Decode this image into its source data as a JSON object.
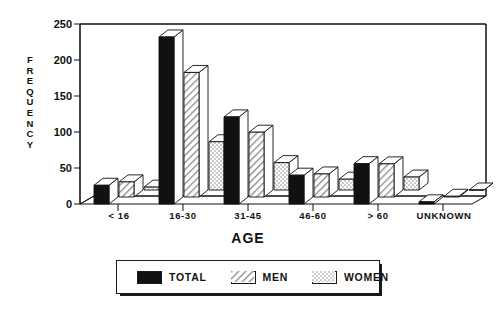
{
  "chart_data": {
    "type": "bar",
    "title": "",
    "xlabel": "AGE",
    "ylabel": "FREQUENCY",
    "categories": [
      "< 16",
      "16-30",
      "31-45",
      "46-60",
      "> 60",
      "UNKNOWN"
    ],
    "series": [
      {
        "name": "TOTAL",
        "values": [
          26,
          232,
          121,
          40,
          56,
          3
        ]
      },
      {
        "name": "MEN",
        "values": [
          21,
          173,
          90,
          32,
          46,
          1
        ]
      },
      {
        "name": "WOMEN",
        "values": [
          4,
          67,
          38,
          15,
          18,
          0
        ]
      }
    ],
    "ylim": [
      0,
      250
    ],
    "yticks": [
      0,
      50,
      100,
      150,
      200,
      250
    ],
    "ytick_labels": [
      "0",
      "50",
      "100",
      "150",
      "200",
      "250"
    ],
    "grid": false,
    "legend_position": "bottom",
    "style": "3d-grouped-bar"
  },
  "axes": {
    "y_title_letters": [
      "F",
      "R",
      "E",
      "Q",
      "U",
      "E",
      "N",
      "C",
      "Y"
    ],
    "x_title": "AGE"
  },
  "legend": {
    "entries": [
      {
        "label": "TOTAL",
        "pattern": "solid-black",
        "color": "#111111"
      },
      {
        "label": "MEN",
        "pattern": "diagonal-hatch",
        "color": "#b8b8b8"
      },
      {
        "label": "WOMEN",
        "pattern": "stipple-dots",
        "color": "#e2e2e2"
      }
    ]
  },
  "colors": {
    "ink": "#111111",
    "total_fill": "#111111",
    "men_fill": "#bdbdbd",
    "women_fill": "#ededed",
    "top_face": "#ffffff",
    "background": "#ffffff"
  }
}
